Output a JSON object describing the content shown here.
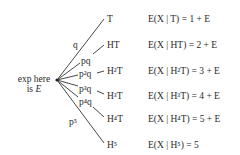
{
  "root": {
    "line1": "exp here",
    "line2_prefix": "is ",
    "line2_var": "E"
  },
  "branches": [
    {
      "prob": "q",
      "outcome": "T",
      "expectation": "E(X | T) = 1 + E"
    },
    {
      "prob": "pq",
      "outcome": "HT",
      "expectation": "E(X | HT) = 2 + E"
    },
    {
      "prob": "p²q",
      "outcome": "H²T",
      "expectation": "E(X | H²T) = 3 + E"
    },
    {
      "prob": "p³q",
      "outcome": "H³T",
      "expectation": "E(X | H³T) = 4 + E"
    },
    {
      "prob": "p⁴q",
      "outcome": "H⁴T",
      "expectation": "E(X | H⁴T) = 5 + E"
    },
    {
      "prob": "p⁵",
      "outcome": "H⁵",
      "expectation": "E(X | H⁵) = 5"
    }
  ]
}
